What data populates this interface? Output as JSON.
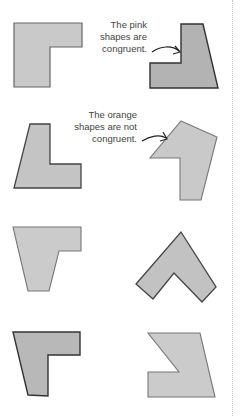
{
  "annotations": {
    "congruent": {
      "lines": [
        "The pink",
        "shapes are",
        "congruent."
      ]
    },
    "not_congruent": {
      "lines": [
        "The orange",
        "shapes are not",
        "congruent."
      ]
    }
  },
  "colors": {
    "fill_light": "#c9c9c9",
    "fill_dark": "#b3b3b3",
    "stroke": "#555555",
    "text": "#444444",
    "divider": "#c8c8c8"
  },
  "shapes": [
    {
      "id": "shape-1",
      "row": 1,
      "column": "left",
      "group": "pink",
      "points": "14,23 82,23 82,47 50,47 50,87 14,87"
    },
    {
      "id": "shape-2",
      "row": 1,
      "column": "right",
      "group": "pink",
      "points": "181,24 203,24 218,88 150,88 150,63 181,63"
    },
    {
      "id": "shape-3",
      "row": 2,
      "column": "left",
      "group": "orange",
      "points": "30,124 50,124 50,164 81,164 81,188 14,188"
    },
    {
      "id": "shape-4",
      "row": 2,
      "column": "right",
      "group": "orange",
      "points": "181,121 217,137 201,200 180,200 180,158 150,158"
    },
    {
      "id": "shape-5",
      "row": 3,
      "column": "left",
      "group": "other",
      "points": "13,227 81,227 81,251 59,251 49,291 28,291"
    },
    {
      "id": "shape-6",
      "row": 3,
      "column": "right",
      "group": "other",
      "points": "181,232 216,287 202,302 174,273 153,299 136,284"
    },
    {
      "id": "shape-7",
      "row": 4,
      "column": "left",
      "group": "other",
      "points": "13,332 80,332 80,355 48,355 48,396 28,395"
    },
    {
      "id": "shape-8",
      "row": 4,
      "column": "right",
      "group": "other",
      "points": "148,333 200,333 215,397 148,397 148,372 179,372"
    }
  ]
}
